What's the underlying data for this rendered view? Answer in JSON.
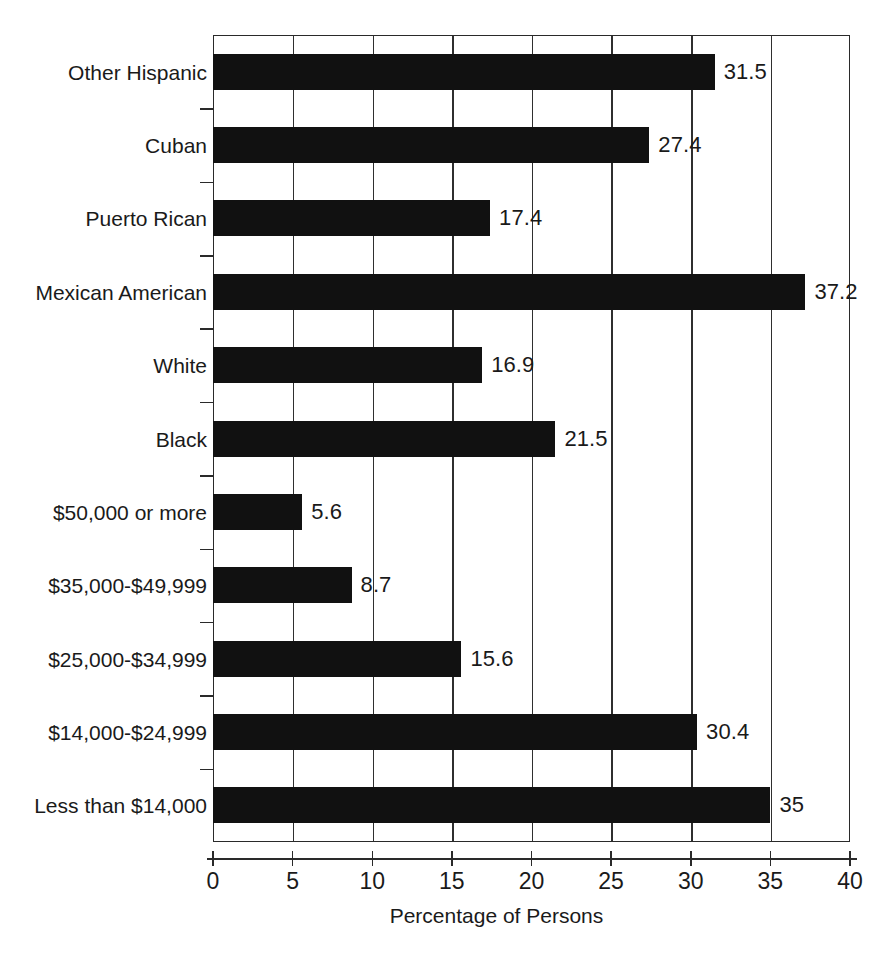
{
  "chart_data": {
    "type": "bar",
    "orientation": "horizontal",
    "title": "",
    "xlabel": "Percentage of Persons",
    "ylabel": "",
    "xlim": [
      0,
      40
    ],
    "xticks": [
      0,
      5,
      10,
      15,
      20,
      25,
      30,
      35,
      40
    ],
    "xtick_labels": [
      "0",
      "5",
      "10",
      "15",
      "20",
      "25",
      "30",
      "35",
      "40"
    ],
    "grid": "vertical",
    "legend": "none",
    "bar_color": "#111111",
    "categories": [
      "Other Hispanic",
      "Cuban",
      "Puerto Rican",
      "Mexican American",
      "White",
      "Black",
      "$50,000 or more",
      "$35,000-$49,999",
      "$25,000-$34,999",
      "$14,000-$24,999",
      "Less than $14,000"
    ],
    "values": [
      31.5,
      27.4,
      17.4,
      37.2,
      16.9,
      21.5,
      5.6,
      8.7,
      15.6,
      30.4,
      35
    ],
    "value_labels": [
      "31.5",
      "27.4",
      "17.4",
      "37.2",
      "16.9",
      "21.5",
      "5.6",
      "8.7",
      "15.6",
      "30.4",
      "35"
    ]
  },
  "colors": {
    "bar": "#111111",
    "axis": "#2a2a2a",
    "grid": "#2f2f2f",
    "text": "#1a1a1a",
    "background": "#ffffff"
  }
}
